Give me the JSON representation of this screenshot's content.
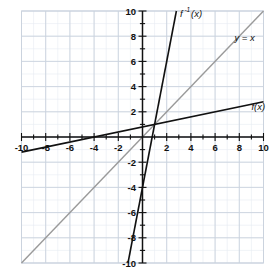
{
  "figure": {
    "title": "",
    "background_color": "#ffffff",
    "width": 278,
    "height": 275
  },
  "chart_data": {
    "type": "line",
    "title": "",
    "subtitle": "",
    "xlabel": "",
    "ylabel": "",
    "xlim": [
      -10,
      10
    ],
    "ylim": [
      -10,
      10
    ],
    "grid": true,
    "grid_minor_step": 1,
    "grid_major_step": 2,
    "grid_color": "#cfd6e0",
    "grid_minor_color": "#e4e9f0",
    "axis_color": "#111111",
    "legend": "inline-labels",
    "legend_position": "inline",
    "x_tick_labels": [
      "-10",
      "-8",
      "-6",
      "-4",
      "-2",
      "2",
      "4",
      "6",
      "8",
      "10"
    ],
    "x_tick_values": [
      -10,
      -8,
      -6,
      -4,
      -2,
      2,
      4,
      6,
      8,
      10
    ],
    "y_tick_labels": [
      "10",
      "8",
      "6",
      "4",
      "2",
      "-2",
      "-4",
      "-6",
      "-8",
      "-10"
    ],
    "y_tick_values": [
      10,
      8,
      6,
      4,
      2,
      -2,
      -4,
      -6,
      -8,
      -10
    ],
    "tick_minor_step": 1,
    "series": [
      {
        "name": "f(x)",
        "label": "f(x)",
        "label_text": "f(x)",
        "equation": "y = 0.2x + 0.8",
        "slope": 0.2,
        "intercept": 0.8,
        "color": "#111111",
        "width": 1.6,
        "x": [
          -10,
          10
        ],
        "values": [
          -1.2,
          2.8
        ],
        "label_x": 9.0,
        "label_y": 2.15
      },
      {
        "name": "f-inverse(x)",
        "label": "f⁻¹(x)",
        "label_base": "f",
        "label_sup": "-1",
        "label_arg": "(x)",
        "equation": "y = 5x - 4",
        "slope": 5,
        "intercept": -4,
        "color": "#111111",
        "width": 1.6,
        "x": [
          -1.2,
          2.8
        ],
        "values": [
          -10,
          10
        ],
        "label_x": 3.1,
        "label_y": 9.55
      },
      {
        "name": "y = x",
        "label": "y = x",
        "label_text": "y = x",
        "equation": "y = x",
        "slope": 1,
        "intercept": 0,
        "color": "#9a9a9a",
        "width": 1.4,
        "x": [
          -10,
          10
        ],
        "values": [
          -10,
          10
        ],
        "label_x": 7.6,
        "label_y": 7.6
      }
    ],
    "annotations": [
      {
        "text": "f(x)",
        "x": 9.0,
        "y": 2.15
      },
      {
        "text": "f⁻¹(x)",
        "x": 3.1,
        "y": 9.55
      },
      {
        "text": "y = x",
        "x": 7.6,
        "y": 7.6
      }
    ]
  },
  "labels": {
    "f": "f",
    "f_paren": "(x)",
    "f_inv_base": "f",
    "f_inv_sup": "-1",
    "f_inv_paren": "(x)",
    "y_equals_x": "y = x"
  }
}
